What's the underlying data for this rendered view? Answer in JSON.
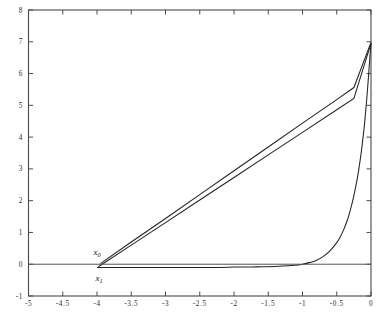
{
  "chart_data": {
    "type": "line",
    "title": "",
    "subtitle": "",
    "xlabel": "",
    "ylabel": "",
    "xlim": [
      -5,
      0
    ],
    "ylim": [
      -1,
      8
    ],
    "grid": false,
    "legend": null,
    "x_ticks": [
      -5,
      -4.5,
      -4,
      -3.5,
      -3,
      -2.5,
      -2,
      -1.5,
      -1,
      -0.5,
      0
    ],
    "x_tick_labels": [
      "-5",
      "-4.5",
      "-4",
      "-3.5",
      "-3",
      "-2.5",
      "-2",
      "-1.5",
      "-1",
      "-0.5",
      "0"
    ],
    "y_ticks": [
      -1,
      0,
      1,
      2,
      3,
      4,
      5,
      6,
      7,
      8
    ],
    "y_tick_labels": [
      "-1",
      "0",
      "1",
      "2",
      "3",
      "4",
      "5",
      "6",
      "7",
      "8"
    ],
    "annotations": [
      {
        "name": "x0",
        "text": "x",
        "sub": "0",
        "x": -4.0,
        "y": 0.3
      },
      {
        "name": "x1",
        "text": "x",
        "sub": "1",
        "x": -3.97,
        "y": -0.52
      }
    ],
    "series": [
      {
        "name": "secant-line",
        "kind": "line",
        "color": "#222222",
        "points": [
          [
            -3.98,
            -0.08
          ],
          [
            -3.5,
            0.6
          ],
          [
            -3.0,
            1.31
          ],
          [
            -2.5,
            2.02
          ],
          [
            -2.0,
            2.73
          ],
          [
            -1.5,
            3.44
          ],
          [
            -1.0,
            4.15
          ],
          [
            -0.5,
            4.86
          ],
          [
            -0.25,
            5.22
          ],
          [
            0.0,
            6.95
          ]
        ]
      },
      {
        "name": "chord-line",
        "kind": "line",
        "color": "#222222",
        "points": [
          [
            -3.95,
            0.02
          ],
          [
            -3.5,
            0.7
          ],
          [
            -3.0,
            1.44
          ],
          [
            -2.5,
            2.19
          ],
          [
            -2.0,
            2.94
          ],
          [
            -1.5,
            3.69
          ],
          [
            -1.0,
            4.44
          ],
          [
            -0.5,
            5.18
          ],
          [
            -0.25,
            5.56
          ],
          [
            0.0,
            6.98
          ]
        ]
      },
      {
        "name": "exponential-curve",
        "kind": "curve",
        "color": "#222222",
        "points": [
          [
            -4.0,
            -0.1
          ],
          [
            -3.5,
            -0.1
          ],
          [
            -3.0,
            -0.1
          ],
          [
            -2.5,
            -0.1
          ],
          [
            -2.2,
            -0.1
          ],
          [
            -2.0,
            -0.09
          ],
          [
            -1.8,
            -0.09
          ],
          [
            -1.6,
            -0.08
          ],
          [
            -1.4,
            -0.07
          ],
          [
            -1.2,
            -0.05
          ],
          [
            -1.1,
            -0.03
          ],
          [
            -1.0,
            0.0
          ],
          [
            -0.9,
            0.05
          ],
          [
            -0.8,
            0.12
          ],
          [
            -0.7,
            0.24
          ],
          [
            -0.6,
            0.42
          ],
          [
            -0.5,
            0.68
          ],
          [
            -0.45,
            0.86
          ],
          [
            -0.4,
            1.08
          ],
          [
            -0.35,
            1.36
          ],
          [
            -0.3,
            1.72
          ],
          [
            -0.25,
            2.16
          ],
          [
            -0.2,
            2.7
          ],
          [
            -0.17,
            3.1
          ],
          [
            -0.14,
            3.56
          ],
          [
            -0.11,
            4.1
          ],
          [
            -0.09,
            4.52
          ],
          [
            -0.07,
            5.0
          ],
          [
            -0.05,
            5.52
          ],
          [
            -0.035,
            5.95
          ],
          [
            -0.022,
            6.34
          ],
          [
            -0.012,
            6.64
          ],
          [
            -0.005,
            6.84
          ],
          [
            0.0,
            6.96
          ]
        ]
      },
      {
        "name": "zero-axis-line",
        "kind": "horizontal",
        "color": "#555555",
        "y": 0
      }
    ]
  },
  "axes": {
    "frame_color": "#4a4a4a",
    "tick_direction": "in"
  }
}
